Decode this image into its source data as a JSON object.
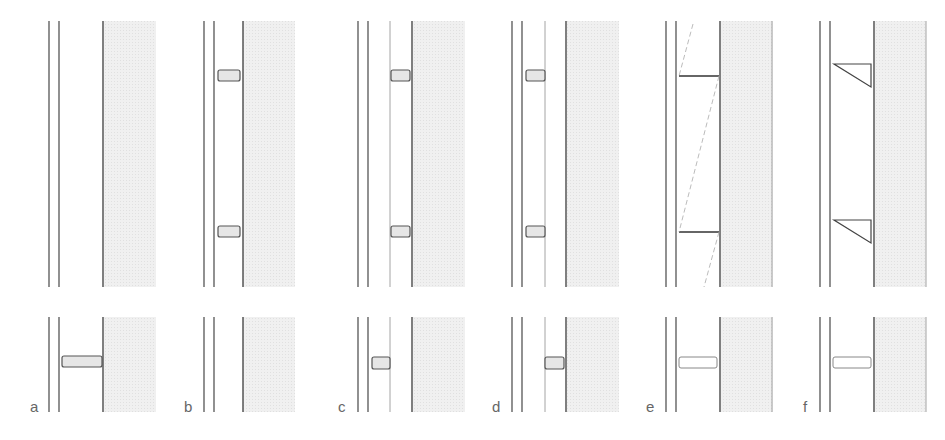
{
  "figure": {
    "colors": {
      "line": "#555555",
      "thin_line": "#9a9a9a",
      "shading": "#ececec",
      "block_fill": "#e6e6e6",
      "label": "#666666"
    },
    "panels": [
      {
        "id": "a",
        "label": "a",
        "top_ties": "none",
        "bottom_tie": "long block spanning cavity"
      },
      {
        "id": "b",
        "label": "b",
        "top_ties": "two blocks at inner leaf",
        "bottom_tie": "none"
      },
      {
        "id": "c",
        "label": "c",
        "top_ties": "two blocks, extra thin line",
        "bottom_tie": "block at inner leaf"
      },
      {
        "id": "d",
        "label": "d",
        "top_ties": "two blocks, extra thin line",
        "bottom_tie": "block at outer leaf"
      },
      {
        "id": "e",
        "label": "e",
        "top_ties": "two horizontal ties with dashed diagonals",
        "bottom_tie": "white block spanning cavity"
      },
      {
        "id": "f",
        "label": "f",
        "top_ties": "two triangular ties",
        "bottom_tie": "white block spanning cavity"
      }
    ]
  }
}
